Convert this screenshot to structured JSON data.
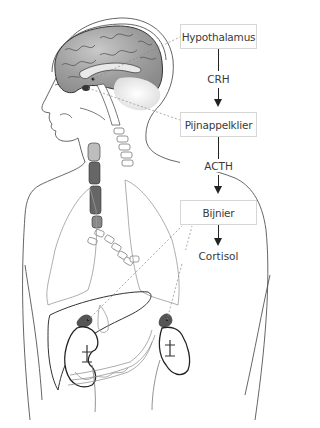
{
  "diagram": {
    "nodes": [
      {
        "id": "hypothalamus",
        "label": "Hypothalamus",
        "type": "box"
      },
      {
        "id": "pijnappelklier",
        "label": "Pijnappelklier",
        "type": "box"
      },
      {
        "id": "bijnier",
        "label": "Bijnier",
        "type": "box"
      }
    ],
    "edges": [
      {
        "from": "hypothalamus",
        "to": "pijnappelklier",
        "label": "CRH"
      },
      {
        "from": "pijnappelklier",
        "to": "bijnier",
        "label": "ACTH"
      },
      {
        "from": "bijnier",
        "to": "cortisol",
        "label": ""
      }
    ],
    "output": {
      "label": "Cortisol"
    },
    "labels": {
      "hypothalamus": "Hypothalamus",
      "crh": "CRH",
      "pijnappelklier": "Pijnappelklier",
      "acth": "ACTH",
      "bijnier": "Bijnier",
      "cortisol": "Cortisol"
    },
    "colors": {
      "outline": "#4a4a4a",
      "brain_fill": "#a9a9a9",
      "box_border": "#d6d6d6",
      "text": "#3a3a3a",
      "arrow": "#222222"
    }
  }
}
